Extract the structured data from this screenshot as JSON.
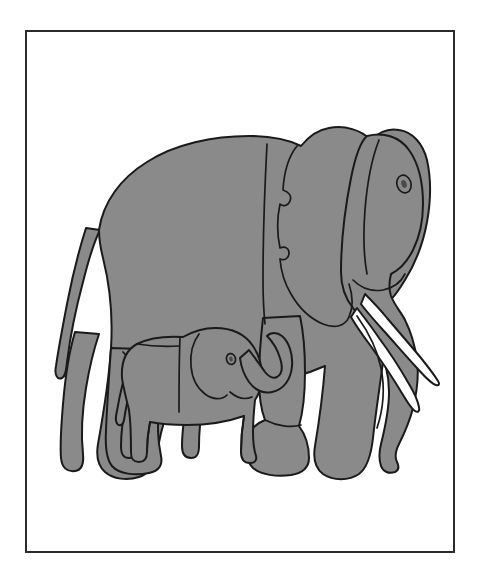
{
  "page": {
    "background_color": "#ffffff",
    "width": 481,
    "height": 569,
    "scan_header_text": ""
  },
  "frame": {
    "border_color": "#2b2b2b",
    "border_width_px": 2,
    "fill_color": "#ffffff",
    "x": 25,
    "y": 30,
    "width": 430,
    "height": 523
  },
  "illustration": {
    "title": "Elephant and calf",
    "style": "line art, flat fill",
    "body_fill_color": "#8a8a8a",
    "outline_color": "#1a1a1a",
    "tusk_fill_color": "#ffffff",
    "outline_width_px": 2,
    "subjects": [
      {
        "name": "adult-elephant",
        "label": "Adult elephant",
        "facing": "right",
        "parts": [
          "body",
          "head",
          "ear",
          "eye",
          "trunk",
          "tusk-upper",
          "tusk-lower",
          "foreleg-near",
          "foreleg-far",
          "hindleg-near",
          "hindleg-far",
          "tail"
        ]
      },
      {
        "name": "baby-elephant",
        "label": "Baby elephant",
        "facing": "right",
        "parts": [
          "body",
          "head",
          "ear",
          "eye",
          "trunk-raised",
          "foreleg-near",
          "foreleg-far",
          "hindleg-near",
          "hindleg-far",
          "tail"
        ]
      }
    ]
  }
}
